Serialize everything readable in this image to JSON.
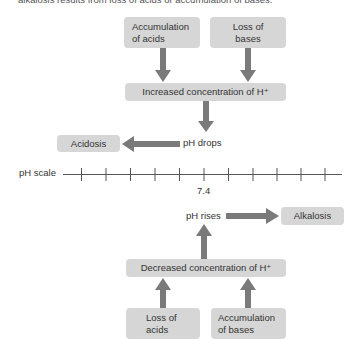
{
  "caption": "alkalosis results from loss of acids or accumulation of bases.",
  "colors": {
    "box_fill": "#d6d6d6",
    "arrow": "#7a7a7a",
    "text": "#333333",
    "scale_line": "#555555"
  },
  "top": {
    "cause_left": {
      "line1": "Accumulation",
      "line2": "of acids"
    },
    "cause_right": {
      "line1": "Loss of",
      "line2": "bases"
    },
    "effect": "Increased concentration of H⁺",
    "result_label": "pH drops",
    "condition": "Acidosis"
  },
  "scale": {
    "label": "pH scale",
    "tick_count": 11,
    "center_value": "7.4"
  },
  "bottom": {
    "result_label": "pH rises",
    "condition": "Alkalosis",
    "effect": "Decreased concentration of H⁺",
    "cause_left": {
      "line1": "Loss of",
      "line2": "acids"
    },
    "cause_right": {
      "line1": "Accumulation",
      "line2": "of bases"
    }
  }
}
